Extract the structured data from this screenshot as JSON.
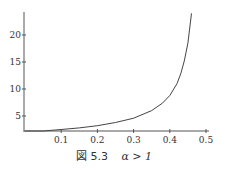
{
  "chart_data": {
    "type": "line",
    "title": "",
    "caption": "図 5.3  α > 1",
    "xlabel": "",
    "ylabel": "",
    "xlim": [
      0,
      0.5
    ],
    "ylim": [
      2.2,
      24
    ],
    "grid": false,
    "legend": null,
    "x_ticks": [
      "0.1",
      "0.2",
      "0.3",
      "0.4",
      "0.5"
    ],
    "y_ticks": [
      "5",
      "10",
      "15",
      "20"
    ],
    "series": [
      {
        "name": "curve",
        "x": [
          0,
          0.05,
          0.1,
          0.15,
          0.2,
          0.25,
          0.3,
          0.35,
          0.38,
          0.4,
          0.42,
          0.43,
          0.44,
          0.45,
          0.46
        ],
        "y": [
          2.0,
          2.2,
          2.5,
          2.8,
          3.2,
          3.8,
          4.6,
          6.0,
          7.4,
          8.8,
          11.0,
          12.8,
          15.2,
          18.5,
          24.0
        ]
      }
    ]
  },
  "caption": {
    "figure_label": "図 5.3",
    "condition": "α > 1"
  }
}
